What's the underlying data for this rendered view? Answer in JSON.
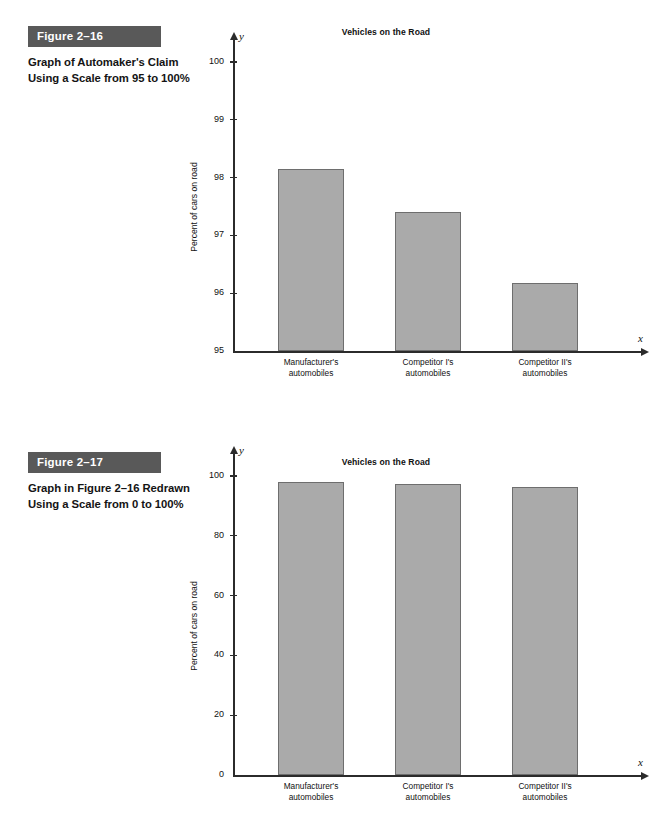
{
  "figures": [
    {
      "tag": "Figure 2–16",
      "caption": "Graph of Automaker's Claim Using a Scale from 95 to 100%"
    },
    {
      "tag": "Figure 2–17",
      "caption": "Graph in Figure 2–16 Redrawn Using a Scale from 0 to 100%"
    }
  ],
  "axis_letters": {
    "x": "x",
    "y": "y"
  },
  "colors": {
    "tag_background": "#595959",
    "bar_fill": "#aaaaaa",
    "bar_border": "#6e6e6e",
    "axis": "#2b2b2b",
    "page_background": "#ffffff"
  },
  "chart_data": [
    {
      "type": "bar",
      "title": "Vehicles on the Road",
      "xlabel": "",
      "ylabel": "Percent of cars on road",
      "categories": [
        "Manufacturer's automobiles",
        "Competitor I's automobiles",
        "Competitor II's automobiles"
      ],
      "category_lines": [
        [
          "Manufacturer's",
          "automobiles"
        ],
        [
          "Competitor I's",
          "automobiles"
        ],
        [
          "Competitor II's",
          "automobiles"
        ]
      ],
      "values": [
        98.15,
        97.4,
        96.17
      ],
      "ylim": [
        95,
        100
      ],
      "yticks": [
        95,
        96,
        97,
        98,
        99,
        100
      ],
      "ytick_labels": [
        "95",
        "96",
        "97",
        "98",
        "99",
        "100"
      ],
      "grid": false,
      "legend": "none"
    },
    {
      "type": "bar",
      "title": "Vehicles on the Road",
      "xlabel": "",
      "ylabel": "Percent of cars on road",
      "categories": [
        "Manufacturer's automobiles",
        "Competitor I's automobiles",
        "Competitor II's automobiles"
      ],
      "category_lines": [
        [
          "Manufacturer's",
          "automobiles"
        ],
        [
          "Competitor I's",
          "automobiles"
        ],
        [
          "Competitor II's",
          "automobiles"
        ]
      ],
      "values": [
        98.15,
        97.4,
        96.17
      ],
      "ylim": [
        0,
        100
      ],
      "yticks": [
        0,
        20,
        40,
        60,
        80,
        100
      ],
      "ytick_labels": [
        "0",
        "20",
        "40",
        "60",
        "80",
        "100"
      ],
      "grid": false,
      "legend": "none"
    }
  ]
}
